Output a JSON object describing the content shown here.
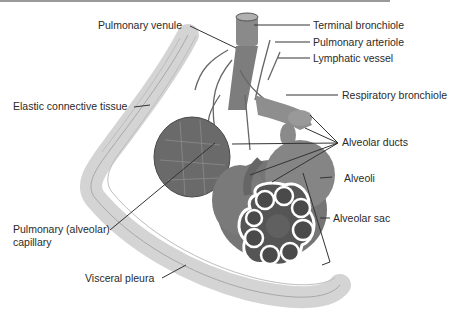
{
  "diagram": {
    "type": "anatomical-illustration",
    "palette": {
      "background": "#ffffff",
      "tissue": "#7a7a7a",
      "pleura": "#d9d9d9",
      "label_text": "#2a2a2a",
      "leader_line": "#333333"
    },
    "labels": {
      "pulmonary_venule": "Pulmonary venule",
      "terminal_bronchiole": "Terminal bronchiole",
      "pulmonary_arteriole": "Pulmonary arteriole",
      "lymphatic_vessel": "Lymphatic vessel",
      "elastic_connective_tissue": "Elastic connective tissue",
      "respiratory_bronchiole": "Respiratory bronchiole",
      "alveolar_ducts": "Alveolar ducts",
      "alveoli": "Alveoli",
      "alveolar_sac": "Alveolar sac",
      "pulmonary_capillary_line1": "Pulmonary (alveolar)",
      "pulmonary_capillary_line2": "capillary",
      "visceral_pleura": "Visceral pleura"
    }
  }
}
